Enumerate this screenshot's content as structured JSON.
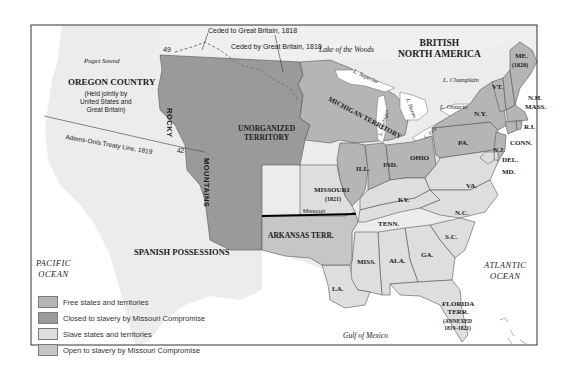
{
  "colors": {
    "free": "#b5b5b5",
    "closed": "#9a9a9a",
    "slave": "#dedede",
    "open": "#c6c6c6",
    "foreign": "#ececec",
    "water": "#ffffff",
    "border": "#555555"
  },
  "regions": {
    "british_north_america": "BRITISH\nNORTH AMERICA",
    "oregon_country": "OREGON COUNTRY",
    "oregon_note": "(Held jointly by\nUnited States and\nGreat Britain)",
    "unorganized_territory": "UNORGANIZED\nTERRITORY",
    "michigan_territory": "MICHIGAN TERRITORY",
    "spanish_possessions": "SPANISH POSSESSIONS",
    "arkansas_terr": "ARKANSAS TERR.",
    "missouri": "MISSOURI",
    "missouri_year": "(1821)",
    "florida": "FLORIDA\nTERR.",
    "florida_note": "(ANNEXED\n1819–1821)",
    "maine": "ME.",
    "maine_year": "(1820)"
  },
  "states": {
    "ill": "ILL.",
    "ind": "IND.",
    "ohio": "OHIO",
    "pa": "PA.",
    "ny": "N.Y.",
    "vt": "VT.",
    "nh": "N.H.",
    "mass": "MASS.",
    "ri": "R.I.",
    "conn": "CONN.",
    "nj": "N.J.",
    "del": "DEL.",
    "md": "MD.",
    "va": "VA.",
    "ky": "KY.",
    "nc": "N.C.",
    "tenn": "TENN.",
    "sc": "S.C.",
    "ga": "GA.",
    "ala": "ALA.",
    "miss": "MISS.",
    "la": "LA."
  },
  "mountains": {
    "rocky": "ROCKY",
    "mountains": "MOUNTAINS"
  },
  "water": {
    "pacific": "PACIFIC\nOCEAN",
    "atlantic": "ATLANTIC\nOCEAN",
    "gulf": "Gulf of Mexico",
    "puget": "Puget Sound",
    "lake_woods": "Lake of the Woods",
    "superior": "L. Superior",
    "michigan": "L. Michigan",
    "huron": "L. Huron",
    "erie": "L. Erie",
    "ontario": "L. Ontario",
    "champlain": "L. Champlain"
  },
  "annotations": {
    "ceded_to": "Ceded to Great Britain, 1818",
    "ceded_by": "Ceded by Great Britain, 1818",
    "adams_onis": "Adams-Onís Treaty Line, 1819",
    "parallel_49": "49",
    "parallel_42": "42",
    "missouri_line": "Missouri"
  },
  "legend": [
    {
      "label": "Free states and territories",
      "color": "#b5b5b5"
    },
    {
      "label": "Closed to slavery by Missouri Compromise",
      "color": "#9a9a9a"
    },
    {
      "label": "Slave states and territories",
      "color": "#dedede"
    },
    {
      "label": "Open to slavery by Missouri Compromise",
      "color": "#c6c6c6"
    }
  ]
}
